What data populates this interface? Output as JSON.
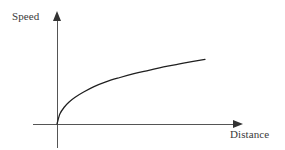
{
  "chart_data": {
    "type": "line",
    "title": "",
    "subtitle": "",
    "xlabel": "Distance",
    "ylabel": "Speed",
    "grid": false,
    "legend": null,
    "axis_style": "arrow-tipped",
    "tick_labels": {
      "x": [],
      "y": []
    },
    "xlim": [
      0,
      1
    ],
    "ylim": [
      0,
      1
    ],
    "annotations": [],
    "series": [
      {
        "name": "speed-vs-distance",
        "shape": "concave-down increasing (square-root like)",
        "color": "#1f1f1f",
        "x": [
          0.0,
          0.02,
          0.05,
          0.08,
          0.12,
          0.18,
          0.25,
          0.33,
          0.42,
          0.52,
          0.62,
          0.72,
          0.82,
          0.92,
          1.0
        ],
        "y": [
          0.0,
          0.15,
          0.25,
          0.32,
          0.39,
          0.47,
          0.55,
          0.62,
          0.68,
          0.74,
          0.79,
          0.84,
          0.88,
          0.92,
          0.95
        ]
      }
    ]
  },
  "figure": {
    "background_color": "#ffffff",
    "axis_color": "#555555",
    "curve_color": "#1f1f1f",
    "label_color": "#3a3a3a"
  }
}
